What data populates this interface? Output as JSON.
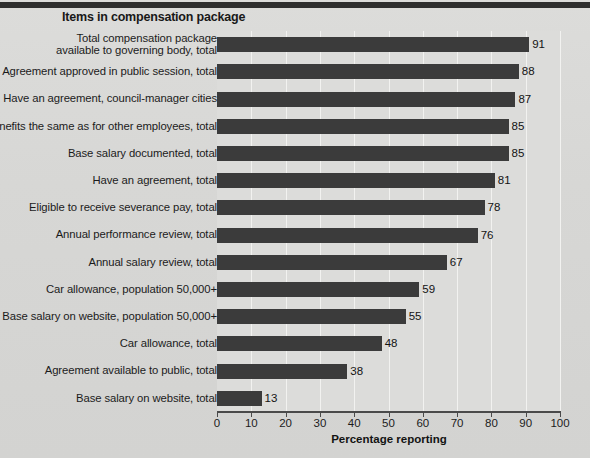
{
  "chart_data": {
    "type": "bar",
    "orientation": "horizontal",
    "title": "Items in compensation package",
    "xlabel": "Percentage reporting",
    "ylabel": "",
    "xlim": [
      0,
      100
    ],
    "xticks": [
      0,
      10,
      20,
      30,
      40,
      50,
      60,
      70,
      80,
      90,
      100
    ],
    "grid": true,
    "legend": "none",
    "bar_color": "#3b3b3b",
    "background_color": "#d9d9d7",
    "categories": [
      "Total compensation package\navailable to governing body, total",
      "Agreement approved in public session, total",
      "Have an agreement, council-manager cities",
      "Benefits the same as for other employees, total",
      "Base salary documented, total",
      "Have an agreement, total",
      "Eligible to receive severance pay, total",
      "Annual performance review, total",
      "Annual salary review, total",
      "Car allowance, population 50,000+",
      "Base salary on website, population 50,000+",
      "Car allowance, total",
      "Agreement available to public, total",
      "Base salary on website, total"
    ],
    "values": [
      91,
      88,
      87,
      85,
      85,
      81,
      78,
      76,
      67,
      59,
      55,
      48,
      38,
      13
    ]
  },
  "notes": {
    "footnote": ""
  }
}
